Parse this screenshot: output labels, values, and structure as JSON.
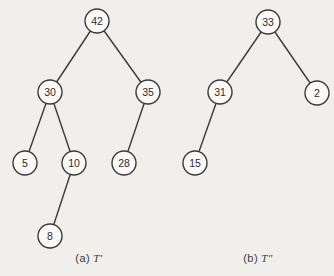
{
  "style": {
    "background": "#f1efec",
    "stroke": "#3b3b3b",
    "node_fill": "#faf9f7",
    "node_radius": 12,
    "edge_width": 1.4
  },
  "trees": [
    {
      "id": "tree-a",
      "nodes": [
        {
          "label": "42",
          "x": 97,
          "y": 21
        },
        {
          "label": "30",
          "x": 50,
          "y": 92
        },
        {
          "label": "35",
          "x": 148,
          "y": 92
        },
        {
          "label": "5",
          "x": 25,
          "y": 163
        },
        {
          "label": "10",
          "x": 74,
          "y": 163
        },
        {
          "label": "28",
          "x": 124,
          "y": 163
        },
        {
          "label": "8",
          "x": 50,
          "y": 236
        }
      ],
      "edges": [
        [
          "42",
          "30"
        ],
        [
          "42",
          "35"
        ],
        [
          "30",
          "5"
        ],
        [
          "30",
          "10"
        ],
        [
          "35",
          "28"
        ],
        [
          "10",
          "8"
        ]
      ]
    },
    {
      "id": "tree-b",
      "nodes": [
        {
          "label": "33",
          "x": 268,
          "y": 22
        },
        {
          "label": "31",
          "x": 220,
          "y": 92
        },
        {
          "label": "2",
          "x": 317,
          "y": 93
        },
        {
          "label": "15",
          "x": 195,
          "y": 163
        }
      ],
      "edges": [
        [
          "33",
          "31"
        ],
        [
          "33",
          "2"
        ],
        [
          "31",
          "15"
        ]
      ]
    }
  ],
  "captions": [
    {
      "prefix": "(a)",
      "symbol": "T′",
      "x": 89,
      "y": 252
    },
    {
      "prefix": "(b)",
      "symbol": "T″",
      "x": 258,
      "y": 252
    }
  ]
}
